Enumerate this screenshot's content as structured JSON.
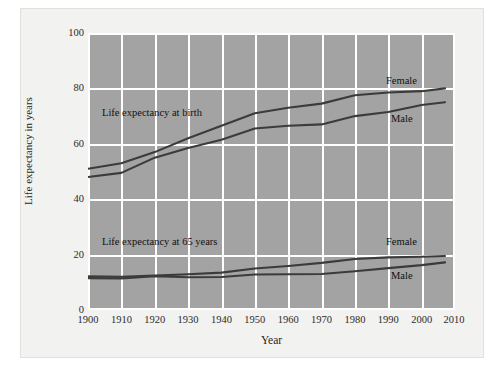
{
  "figure": {
    "background_color": "#f2f2f0",
    "plot_background_color": "#a3a3a3",
    "grid_color": "#ffffff",
    "line_color": "#3b3b3b"
  },
  "axes": {
    "xlabel": "Year",
    "ylabel": "Life expectancy in years",
    "yticks": [
      "100",
      "80",
      "60",
      "40",
      "20",
      "0"
    ],
    "xticks": [
      "1900",
      "1910",
      "1920",
      "1930",
      "1940",
      "1950",
      "1960",
      "1970",
      "1980",
      "1990",
      "2000",
      "2010"
    ]
  },
  "annotations": {
    "birth_group": "Life expectancy at birth",
    "age65_group": "Life expectancy at 65 years",
    "birth_female": "Female",
    "birth_male": "Male",
    "age65_female": "Female",
    "age65_male": "Male"
  },
  "chart_data": {
    "type": "line",
    "title": "",
    "xlabel": "Year",
    "ylabel": "Life expectancy in years",
    "xlim": [
      1900,
      2010
    ],
    "ylim": [
      0,
      100
    ],
    "grid": true,
    "legend_position": "inline-annotations",
    "x": [
      1900,
      1910,
      1920,
      1930,
      1940,
      1950,
      1960,
      1970,
      1980,
      1990,
      2000,
      2007
    ],
    "series": [
      {
        "name": "Life expectancy at birth, Female",
        "values": [
          51.0,
          53.0,
          57.0,
          62.0,
          66.5,
          71.0,
          73.0,
          74.5,
          77.5,
          78.5,
          79.0,
          80.0
        ]
      },
      {
        "name": "Life expectancy at birth, Male",
        "values": [
          48.0,
          49.5,
          55.0,
          58.5,
          61.5,
          65.5,
          66.5,
          67.0,
          70.0,
          71.5,
          74.0,
          75.0
        ]
      },
      {
        "name": "Life expectancy at 65 years, Female",
        "values": [
          12.2,
          12.0,
          12.4,
          12.9,
          13.5,
          15.0,
          15.9,
          17.0,
          18.4,
          19.0,
          19.2,
          19.5
        ]
      },
      {
        "name": "Life expectancy at 65 years, Male",
        "values": [
          11.5,
          11.4,
          12.2,
          11.8,
          11.9,
          12.8,
          12.9,
          13.0,
          14.0,
          15.1,
          16.2,
          17.2
        ]
      }
    ]
  }
}
